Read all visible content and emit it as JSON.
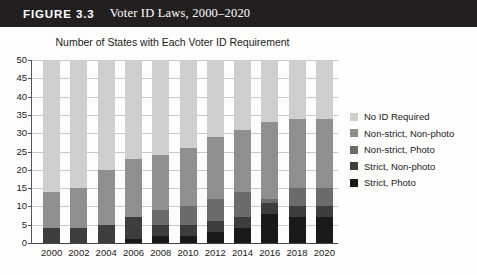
{
  "figure": {
    "number_label": "FIGURE 3.3",
    "title": "Voter ID Laws, 2000–2020"
  },
  "chart_data": {
    "type": "bar",
    "stacked": true,
    "title": "Number of States with Each Voter ID Requirement",
    "xlabel": "",
    "ylabel": "",
    "ylim": [
      0,
      50
    ],
    "ytick_step": 5,
    "yticks": [
      0,
      5,
      10,
      15,
      20,
      25,
      30,
      35,
      40,
      45,
      50
    ],
    "grid": true,
    "legend_position": "right",
    "categories": [
      "2000",
      "2002",
      "2004",
      "2006",
      "2008",
      "2010",
      "2012",
      "2014",
      "2016",
      "2018",
      "2020"
    ],
    "series": [
      {
        "name": "Strict, Photo",
        "color": "#1a1a1a",
        "values": [
          0,
          0,
          0,
          1,
          2,
          2,
          3,
          4,
          8,
          7,
          7
        ]
      },
      {
        "name": "Strict, Non-photo",
        "color": "#3d3d3d",
        "values": [
          4,
          4,
          5,
          6,
          3,
          3,
          3,
          3,
          3,
          3,
          3
        ]
      },
      {
        "name": "Non-strict, Photo",
        "color": "#6b6b6b",
        "values": [
          0,
          0,
          0,
          0,
          4,
          5,
          6,
          7,
          1,
          5,
          5
        ]
      },
      {
        "name": "Non-strict, Non-photo",
        "color": "#8f8f8f",
        "values": [
          10,
          11,
          15,
          16,
          15,
          16,
          17,
          17,
          21,
          19,
          19
        ]
      },
      {
        "name": "No ID Required",
        "color": "#cfcfcf",
        "values": [
          36,
          35,
          30,
          27,
          26,
          24,
          21,
          19,
          17,
          16,
          16
        ]
      }
    ],
    "totals": [
      50,
      50,
      50,
      50,
      50,
      50,
      50,
      50,
      50,
      50,
      50
    ],
    "legend": [
      {
        "label": "No ID Required",
        "color": "#cfcfcf"
      },
      {
        "label": "Non-strict, Non-photo",
        "color": "#8f8f8f"
      },
      {
        "label": "Non-strict, Photo",
        "color": "#6b6b6b"
      },
      {
        "label": "Strict, Non-photo",
        "color": "#3d3d3d"
      },
      {
        "label": "Strict, Photo",
        "color": "#1a1a1a"
      }
    ]
  }
}
